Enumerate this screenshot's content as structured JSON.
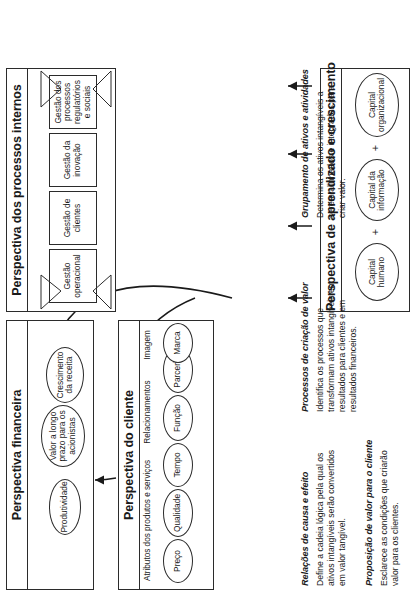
{
  "diagram": {
    "perspectives": [
      {
        "id": "financeira",
        "title": "Perspectiva financeira",
        "nodes": [
          {
            "name": "valor-longo-prazo",
            "label": "Valor a longo prazo para os acionistas"
          },
          {
            "name": "produtividade",
            "label": "Produtividade"
          },
          {
            "name": "crescimento-receita",
            "label": "Crescimento da receita"
          }
        ]
      },
      {
        "id": "cliente",
        "title": "Perspectiva do cliente",
        "groups": [
          {
            "name": "atributos",
            "label": "Atributos dos produtos e serviços"
          },
          {
            "name": "relacionamentos",
            "label": "Relacionamentos"
          },
          {
            "name": "imagem",
            "label": "Imagem"
          }
        ],
        "nodes": [
          {
            "name": "preco",
            "label": "Preço"
          },
          {
            "name": "qualidade",
            "label": "Qualidade"
          },
          {
            "name": "tempo",
            "label": "Tempo"
          },
          {
            "name": "funcao",
            "label": "Função"
          },
          {
            "name": "parcerias",
            "label": "Parcerias"
          },
          {
            "name": "marca",
            "label": "Marca"
          }
        ]
      },
      {
        "id": "processos",
        "title": "Perspectiva dos processos internos",
        "nodes": [
          {
            "name": "gestao-operacional",
            "label": "Gestão operacional"
          },
          {
            "name": "gestao-clientes",
            "label": "Gestão de clientes"
          },
          {
            "name": "gestao-inovacao",
            "label": "Gestão da inovação"
          },
          {
            "name": "gestao-regulatorios",
            "label": "Gestão dos processos regulatórios e sociais"
          }
        ]
      },
      {
        "id": "aprendizado",
        "title": "Perspectiva de aprendizado e crescimento",
        "nodes": [
          {
            "name": "capital-humano",
            "label": "Capital humano"
          },
          {
            "name": "capital-informacao",
            "label": "Capital da informação"
          },
          {
            "name": "capital-organizacional",
            "label": "Capital organizacional"
          }
        ],
        "operators": [
          "+",
          "+"
        ]
      }
    ],
    "notes": [
      {
        "id": "causa-efeito",
        "heading": "Relações de causa e efeito",
        "body": "Define a cadeia lógica pela qual os ativos intangíveis serão convertidos em valor tangível."
      },
      {
        "id": "proposicao-valor",
        "heading": "Proposição de valor para o cliente",
        "body": "Esclarece as condições que criarão valor para os clientes."
      },
      {
        "id": "processos-criacao-valor",
        "heading": "Processos de criação de valor",
        "body": "Identifica os processos que transformam ativos intangíveis em resultados para clientes e em resultados financeiros."
      },
      {
        "id": "grupamento-ativos",
        "heading": "Grupamento de ativos e atividades",
        "body": "Determina os ativos intangíveis a serem alinhados e integrados para criar valor."
      }
    ]
  }
}
